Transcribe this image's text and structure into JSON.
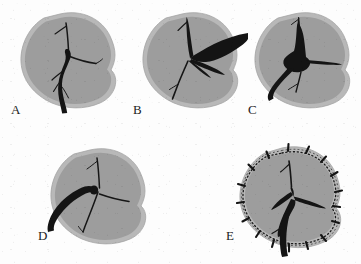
{
  "figure": {
    "type": "medical-illustration-panel-series",
    "caption_labels": [
      "A",
      "B",
      "C",
      "D",
      "E"
    ],
    "background_color": "#fdfdfd",
    "organ_fill_color": "#9d9d9d",
    "organ_capsule_color": "#b6b6b6",
    "organ_outline_color": "#8a8a8a",
    "vessel_color": "#141414",
    "suture_color": "#1a1a1a",
    "label_color": "#222222"
  },
  "panels": [
    {
      "id": "A",
      "label": "A",
      "label_x": 11,
      "label_y": 103,
      "description": "Organ with intact branching vascular pedicle entering from inferior aspect",
      "organ_x": 18,
      "organ_y": 14,
      "organ_w": 96,
      "organ_h": 92,
      "vessel_style": "thin-branching-tree-with-thick-inferior-trunk"
    },
    {
      "id": "B",
      "label": "B",
      "label_x": 133,
      "label_y": 103,
      "description": "Thick instrument or engorged vessel entering from the lateral right aspect with fanning branches",
      "organ_x": 138,
      "organ_y": 14,
      "organ_w": 96,
      "organ_h": 92,
      "vessel_style": "thick-lateral-entry-with-fanned-branches"
    },
    {
      "id": "C",
      "label": "C",
      "label_x": 253,
      "label_y": 103,
      "description": "Central hilar mass with thick vessel exiting inferolaterally",
      "organ_x": 250,
      "organ_y": 14,
      "organ_w": 96,
      "organ_h": 92,
      "vessel_style": "central-dense-mass-with-inferolateral-trunk"
    },
    {
      "id": "D",
      "label": "D",
      "label_x": 38,
      "label_y": 233,
      "description": "Thin branching tree with thick blunt vessel stump entering from inferolateral left",
      "organ_x": 48,
      "organ_y": 150,
      "organ_w": 96,
      "organ_h": 92,
      "vessel_style": "thin-tree-with-blunt-left-stump"
    },
    {
      "id": "E",
      "label": "E",
      "label_x": 228,
      "label_y": 233,
      "description": "Organ wrapped in mesh or encircled by a dotted suture line with radial staples around the entire perimeter",
      "organ_x": 238,
      "organ_y": 148,
      "organ_w": 100,
      "organ_h": 96,
      "vessel_style": "broad-triradiate-hilar-vessels-with-inferior-trunk",
      "has_suture_ring": true,
      "suture_tick_count": 16
    }
  ]
}
